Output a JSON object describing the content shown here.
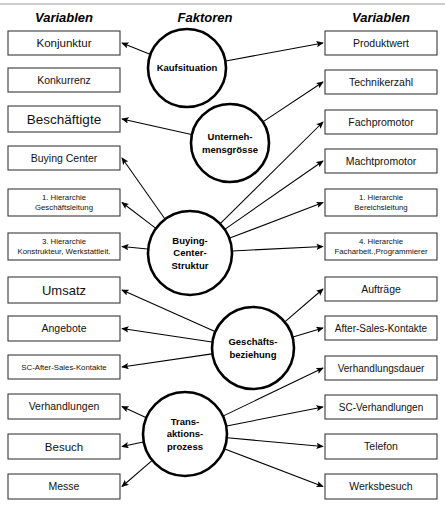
{
  "headers": {
    "left": "Variablen",
    "center": "Faktoren",
    "right": "Variablen"
  },
  "colors": {
    "box_stroke": "#3a3a3a",
    "circle_stroke": "#000000",
    "arrow": "#000000",
    "text": "#111111",
    "background": "#ffffff",
    "top_rule": "#9a9a9a"
  },
  "left_variables": [
    {
      "id": "konjunktur",
      "lines": [
        "Konjunktur"
      ],
      "font_size": 11.5,
      "x": 8,
      "y": 31,
      "w": 112,
      "h": 24
    },
    {
      "id": "konkurrenz",
      "lines": [
        "Konkurrenz"
      ],
      "font_size": 10.5,
      "x": 8,
      "y": 68,
      "w": 112,
      "h": 24
    },
    {
      "id": "beschaeftigte",
      "lines": [
        "Beschäftigte"
      ],
      "font_size": 13.5,
      "x": 8,
      "y": 106,
      "w": 112,
      "h": 26
    },
    {
      "id": "buying-center",
      "lines": [
        "Buying Center"
      ],
      "font_size": 10.5,
      "x": 8,
      "y": 146,
      "w": 112,
      "h": 24
    },
    {
      "id": "hierarchie-1-geschaeftsleitung",
      "lines": [
        "1.    Hierarchie",
        "Geschäftsleitung"
      ],
      "font_size": 7.8,
      "x": 8,
      "y": 189,
      "w": 112,
      "h": 27
    },
    {
      "id": "hierarchie-3-konstrukteur",
      "lines": [
        "3.    Hierarchie",
        "Konstrukteur, Werkstattleit."
      ],
      "font_size": 7.8,
      "x": 8,
      "y": 233,
      "w": 112,
      "h": 27
    },
    {
      "id": "umsatz",
      "lines": [
        "Umsatz"
      ],
      "font_size": 13,
      "x": 8,
      "y": 277,
      "w": 112,
      "h": 26
    },
    {
      "id": "angebote",
      "lines": [
        "Angebote"
      ],
      "font_size": 10.5,
      "x": 8,
      "y": 316,
      "w": 112,
      "h": 25
    },
    {
      "id": "sc-after-sales-kontakte",
      "lines": [
        "SC-After-Sales-Kontakte"
      ],
      "font_size": 7.8,
      "x": 8,
      "y": 355,
      "w": 112,
      "h": 24
    },
    {
      "id": "verhandlungen",
      "lines": [
        "Verhandlungen"
      ],
      "font_size": 10.5,
      "x": 8,
      "y": 394,
      "w": 112,
      "h": 25
    },
    {
      "id": "besuch",
      "lines": [
        "Besuch"
      ],
      "font_size": 11.5,
      "x": 8,
      "y": 434,
      "w": 112,
      "h": 25
    },
    {
      "id": "messe",
      "lines": [
        "Messe"
      ],
      "font_size": 10.5,
      "x": 8,
      "y": 474,
      "w": 112,
      "h": 25
    }
  ],
  "right_variables": [
    {
      "id": "produktwert",
      "lines": [
        "Produktwert"
      ],
      "font_size": 10.5,
      "x": 325,
      "y": 31,
      "w": 112,
      "h": 24
    },
    {
      "id": "technikerzahl",
      "lines": [
        "Technikerzahl"
      ],
      "font_size": 10.5,
      "x": 325,
      "y": 70,
      "w": 112,
      "h": 24
    },
    {
      "id": "fachpromotor",
      "lines": [
        "Fachpromotor"
      ],
      "font_size": 10.5,
      "x": 325,
      "y": 110,
      "w": 112,
      "h": 24
    },
    {
      "id": "machtpromotor",
      "lines": [
        "Machtpromotor"
      ],
      "font_size": 10.5,
      "x": 325,
      "y": 149,
      "w": 112,
      "h": 24
    },
    {
      "id": "hierarchie-1-bereichsleitung",
      "lines": [
        "1.    Hierarchie",
        "Bereichsleitung"
      ],
      "font_size": 7.8,
      "x": 325,
      "y": 189,
      "w": 112,
      "h": 27
    },
    {
      "id": "hierarchie-4-facharbeiter",
      "lines": [
        "4.    Hierarchie",
        "Facharbeit.,Programmierer"
      ],
      "font_size": 7.8,
      "x": 325,
      "y": 233,
      "w": 112,
      "h": 27
    },
    {
      "id": "auftraege",
      "lines": [
        "Aufträge"
      ],
      "font_size": 10.5,
      "x": 325,
      "y": 277,
      "w": 112,
      "h": 24
    },
    {
      "id": "after-sales-kontakte",
      "lines": [
        "After-Sales-Kontakte"
      ],
      "font_size": 10,
      "x": 325,
      "y": 316,
      "w": 112,
      "h": 24
    },
    {
      "id": "verhandlungsdauer",
      "lines": [
        "Verhandlungsdauer"
      ],
      "font_size": 10,
      "x": 325,
      "y": 356,
      "w": 112,
      "h": 24
    },
    {
      "id": "sc-verhandlungen",
      "lines": [
        "SC-Verhandlungen"
      ],
      "font_size": 10,
      "x": 325,
      "y": 395,
      "w": 112,
      "h": 24
    },
    {
      "id": "telefon",
      "lines": [
        "Telefon"
      ],
      "font_size": 10.5,
      "x": 325,
      "y": 434,
      "w": 112,
      "h": 25
    },
    {
      "id": "werksbesuch",
      "lines": [
        "Werksbesuch"
      ],
      "font_size": 10.5,
      "x": 325,
      "y": 474,
      "w": 112,
      "h": 25
    }
  ],
  "factors": [
    {
      "id": "kaufsituation",
      "lines": [
        "Kaufsituation"
      ],
      "font_size": 9.5,
      "cx": 187,
      "cy": 68,
      "r": 39
    },
    {
      "id": "unternehmensgroesse",
      "lines": [
        "Unterneh-",
        "mensgrösse"
      ],
      "font_size": 9.5,
      "cx": 230,
      "cy": 143,
      "r": 39
    },
    {
      "id": "buying-center-struktur",
      "lines": [
        "Buying-",
        "Center-",
        "Struktur"
      ],
      "font_size": 9.5,
      "cx": 190,
      "cy": 253,
      "r": 42
    },
    {
      "id": "geschaeftsbeziehung",
      "lines": [
        "Geschäfts-",
        "beziehung"
      ],
      "font_size": 9.5,
      "cx": 253,
      "cy": 348,
      "r": 41
    },
    {
      "id": "transaktionsprozess",
      "lines": [
        "Trans-",
        "aktions-",
        "prozess"
      ],
      "font_size": 9.5,
      "cx": 185,
      "cy": 434,
      "r": 42
    }
  ],
  "links": [
    {
      "from": "kaufsituation",
      "to": "konjunktur",
      "side": "left"
    },
    {
      "from": "kaufsituation",
      "to": "produktwert",
      "side": "right"
    },
    {
      "from": "unternehmensgroesse",
      "to": "beschaeftigte",
      "side": "left"
    },
    {
      "from": "unternehmensgroesse",
      "to": "technikerzahl",
      "side": "right"
    },
    {
      "from": "buying-center-struktur",
      "to": "buying-center",
      "side": "left"
    },
    {
      "from": "buying-center-struktur",
      "to": "hierarchie-1-geschaeftsleitung",
      "side": "left"
    },
    {
      "from": "buying-center-struktur",
      "to": "hierarchie-3-konstrukteur",
      "side": "left"
    },
    {
      "from": "buying-center-struktur",
      "to": "fachpromotor",
      "side": "right"
    },
    {
      "from": "buying-center-struktur",
      "to": "machtpromotor",
      "side": "right"
    },
    {
      "from": "buying-center-struktur",
      "to": "hierarchie-1-bereichsleitung",
      "side": "right"
    },
    {
      "from": "buying-center-struktur",
      "to": "hierarchie-4-facharbeiter",
      "side": "right"
    },
    {
      "from": "geschaeftsbeziehung",
      "to": "umsatz",
      "side": "left"
    },
    {
      "from": "geschaeftsbeziehung",
      "to": "angebote",
      "side": "left"
    },
    {
      "from": "geschaeftsbeziehung",
      "to": "sc-after-sales-kontakte",
      "side": "left"
    },
    {
      "from": "geschaeftsbeziehung",
      "to": "auftraege",
      "side": "right"
    },
    {
      "from": "geschaeftsbeziehung",
      "to": "after-sales-kontakte",
      "side": "right"
    },
    {
      "from": "transaktionsprozess",
      "to": "verhandlungen",
      "side": "left"
    },
    {
      "from": "transaktionsprozess",
      "to": "besuch",
      "side": "left"
    },
    {
      "from": "transaktionsprozess",
      "to": "messe",
      "side": "left"
    },
    {
      "from": "transaktionsprozess",
      "to": "verhandlungsdauer",
      "side": "right"
    },
    {
      "from": "transaktionsprozess",
      "to": "sc-verhandlungen",
      "side": "right"
    },
    {
      "from": "transaktionsprozess",
      "to": "telefon",
      "side": "right"
    },
    {
      "from": "transaktionsprozess",
      "to": "werksbesuch",
      "side": "right"
    }
  ]
}
